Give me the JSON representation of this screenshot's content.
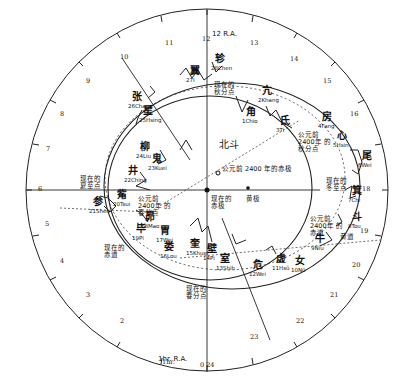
{
  "diagram": {
    "center": {
      "x": 207,
      "y": 190
    },
    "outer_circle_radius": 180,
    "ra_label_top": "12 R.A.",
    "ra_label_bottom": "1hr. R.A.",
    "ra_hour_ticks": [
      {
        "label": "0 24",
        "x": 200,
        "y": 366
      },
      {
        "label": "1hr.",
        "x": 162,
        "y": 363
      },
      {
        "label": "2",
        "x": 120,
        "y": 322
      },
      {
        "label": "3",
        "x": 86,
        "y": 296
      },
      {
        "label": "4",
        "x": 60,
        "y": 262
      },
      {
        "label": "5",
        "x": 45,
        "y": 225
      },
      {
        "label": "6",
        "x": 38,
        "y": 190
      },
      {
        "label": "7",
        "x": 46,
        "y": 150
      },
      {
        "label": "8",
        "x": 60,
        "y": 115
      },
      {
        "label": "9",
        "x": 86,
        "y": 82
      },
      {
        "label": "10",
        "x": 120,
        "y": 58
      },
      {
        "label": "11",
        "x": 165,
        "y": 44
      },
      {
        "label": "12",
        "x": 202,
        "y": 40
      },
      {
        "label": "13",
        "x": 250,
        "y": 44
      },
      {
        "label": "14",
        "x": 290,
        "y": 60
      },
      {
        "label": "15",
        "x": 323,
        "y": 82
      },
      {
        "label": "16",
        "x": 350,
        "y": 115
      },
      {
        "label": "18",
        "x": 362,
        "y": 190
      },
      {
        "label": "19",
        "x": 360,
        "y": 232
      },
      {
        "label": "20",
        "x": 352,
        "y": 266
      },
      {
        "label": "21",
        "x": 330,
        "y": 296
      },
      {
        "label": "22",
        "x": 296,
        "y": 322
      },
      {
        "label": "23",
        "x": 250,
        "y": 338
      }
    ],
    "degree_ticks": [
      {
        "label": "0",
        "x": 207,
        "y": 378
      },
      {
        "label": "10",
        "x": 178,
        "y": 376
      },
      {
        "label": "350",
        "x": 238,
        "y": 376
      },
      {
        "label": "170",
        "x": 60,
        "y": 26
      },
      {
        "label": "160",
        "x": 34,
        "y": 32
      },
      {
        "label": "150",
        "x": 24,
        "y": 47
      },
      {
        "label": "140",
        "x": 33,
        "y": 63
      },
      {
        "label": "130",
        "x": 46,
        "y": 94
      },
      {
        "label": "120",
        "x": 66,
        "y": 35
      },
      {
        "label": "110",
        "x": 30,
        "y": 128
      },
      {
        "label": "100",
        "x": 26,
        "y": 160
      },
      {
        "label": "90",
        "x": 20,
        "y": 190
      },
      {
        "label": "80",
        "x": 28,
        "y": 214
      },
      {
        "label": "70",
        "x": 37,
        "y": 242
      },
      {
        "label": "60",
        "x": 49,
        "y": 272
      },
      {
        "label": "50",
        "x": 66,
        "y": 297
      },
      {
        "label": "40",
        "x": 88,
        "y": 320
      },
      {
        "label": "30",
        "x": 116,
        "y": 340
      },
      {
        "label": "20",
        "x": 144,
        "y": 356
      },
      {
        "label": "180",
        "x": 207,
        "y": 18
      },
      {
        "label": "190",
        "x": 243,
        "y": 22
      },
      {
        "label": "200",
        "x": 268,
        "y": 30
      },
      {
        "label": "210",
        "x": 295,
        "y": 42
      },
      {
        "label": "220",
        "x": 320,
        "y": 60
      },
      {
        "label": "230",
        "x": 344,
        "y": 82
      },
      {
        "label": "240",
        "x": 363,
        "y": 118
      },
      {
        "label": "250",
        "x": 370,
        "y": 132
      },
      {
        "label": "260",
        "x": 380,
        "y": 158
      },
      {
        "label": "270",
        "x": 390,
        "y": 190
      },
      {
        "label": "280",
        "x": 385,
        "y": 215
      },
      {
        "label": "290",
        "x": 383,
        "y": 243
      },
      {
        "label": "300",
        "x": 372,
        "y": 272
      },
      {
        "label": "310",
        "x": 350,
        "y": 297
      },
      {
        "label": "320",
        "x": 328,
        "y": 318
      },
      {
        "label": "330",
        "x": 301,
        "y": 338
      }
    ],
    "mansions": [
      {
        "num": "1",
        "name": "Chio",
        "cn": "角",
        "x": 246,
        "y": 113
      },
      {
        "num": "2",
        "name": "Khang",
        "cn": "亢",
        "x": 262,
        "y": 92
      },
      {
        "num": "3",
        "name": "Ti",
        "cn": "氐",
        "x": 280,
        "y": 122
      },
      {
        "num": "4",
        "name": "Fang",
        "cn": "房",
        "x": 322,
        "y": 118
      },
      {
        "num": "5",
        "name": "Hsin",
        "cn": "心",
        "x": 337,
        "y": 137
      },
      {
        "num": "6",
        "name": "Wei",
        "cn": "尾",
        "x": 362,
        "y": 157
      },
      {
        "num": "7",
        "name": "Chi",
        "cn": "箕",
        "x": 352,
        "y": 192
      },
      {
        "num": "8",
        "name": "Tou",
        "cn": "斗",
        "x": 352,
        "y": 218
      },
      {
        "num": "9",
        "name": "Niu",
        "cn": "牛",
        "x": 315,
        "y": 240
      },
      {
        "num": "10",
        "name": "Nü",
        "cn": "女",
        "x": 295,
        "y": 262
      },
      {
        "num": "11",
        "name": "Hsü",
        "cn": "虚",
        "x": 276,
        "y": 260
      },
      {
        "num": "12",
        "name": "Wei",
        "cn": "危",
        "x": 253,
        "y": 266
      },
      {
        "num": "13",
        "name": "Shih",
        "cn": "室",
        "x": 220,
        "y": 260
      },
      {
        "num": "14",
        "name": "Pi",
        "cn": "壁",
        "x": 207,
        "y": 250
      },
      {
        "num": "15",
        "name": "Khuei",
        "cn": "奎",
        "x": 190,
        "y": 245
      },
      {
        "num": "16",
        "name": "Lou",
        "cn": "娄",
        "x": 164,
        "y": 248
      },
      {
        "num": "17",
        "name": "Wei",
        "cn": "胃",
        "x": 160,
        "y": 232
      },
      {
        "num": "18",
        "name": "Mao",
        "cn": "昴",
        "x": 145,
        "y": 218
      },
      {
        "num": "19",
        "name": "Pi",
        "cn": "毕",
        "x": 136,
        "y": 230
      },
      {
        "num": "20",
        "name": "Tsui",
        "cn": "觜",
        "x": 117,
        "y": 196
      },
      {
        "num": "21",
        "name": "Shen",
        "cn": "参",
        "x": 93,
        "y": 203
      },
      {
        "num": "22",
        "name": "Ching",
        "cn": "井",
        "x": 128,
        "y": 172
      },
      {
        "num": "23",
        "name": "Kuei",
        "cn": "鬼",
        "x": 152,
        "y": 160
      },
      {
        "num": "24",
        "name": "Liu",
        "cn": "柳",
        "x": 140,
        "y": 148
      },
      {
        "num": "25",
        "name": "Hsing",
        "cn": "星",
        "x": 143,
        "y": 112
      },
      {
        "num": "26",
        "name": "Chang",
        "cn": "张",
        "x": 132,
        "y": 98
      },
      {
        "num": "27",
        "name": "I",
        "cn": "翼",
        "x": 190,
        "y": 72
      },
      {
        "num": "28",
        "name": "Chen",
        "cn": "轸",
        "x": 215,
        "y": 60
      }
    ],
    "annotations": {
      "north_dipper": "北斗",
      "pole_2400bc": "公元前 2400 年的赤极",
      "pole_now": "现在的 赤极",
      "ecliptic_pole": "黄极",
      "autumn_equinox_now": "现在的 秋分点",
      "autumn_equinox_2400bc": "公元前 2400年 的秋分点",
      "winter_solstice_now": "现在的 冬至点",
      "summer_solstice_now": "现在的 夏至点",
      "spring_equinox_now": "现在的 春分点",
      "spring_equinox_2400bc": "公元前 2400年 的春分点",
      "equator_now": "现在的 赤道",
      "equator_2400bc": "公元前 2400年 的赤道",
      "ecliptic": "黄道"
    }
  }
}
